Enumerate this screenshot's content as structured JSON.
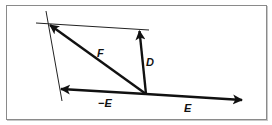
{
  "diagram": {
    "colors": {
      "stroke": "#111111",
      "guide": "#222222",
      "frame": "#8a8a8a"
    },
    "vectors": [
      {
        "id": "F",
        "label": "F"
      },
      {
        "id": "D",
        "label": "D"
      },
      {
        "id": "negE",
        "label": "−E"
      },
      {
        "id": "E",
        "label": "E"
      }
    ],
    "guides": [
      {
        "id": "top-parallel",
        "description": "line through tip of F parallel to E"
      },
      {
        "id": "left-parallel",
        "description": "line through tip of F parallel to D"
      }
    ]
  }
}
